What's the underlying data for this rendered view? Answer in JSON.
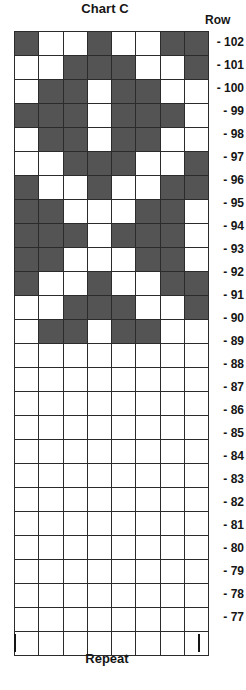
{
  "title": "Chart C",
  "row_header": "Row",
  "repeat_label": "Repeat",
  "colors": {
    "filled": "#545454",
    "empty": "#ffffff",
    "grid_line": "#2b2b2b",
    "text": "#151515"
  },
  "chart_data": {
    "type": "heatmap",
    "title": "Chart C",
    "xlabel": "Repeat",
    "ylabel": "Row",
    "columns": 8,
    "rows": 26,
    "legend": [
      {
        "symbol": "filled",
        "color": "#545454"
      },
      {
        "symbol": "empty",
        "color": "#ffffff"
      }
    ],
    "row_labels": [
      "- 102",
      "- 101",
      "- 100",
      "- 99",
      "- 98",
      "- 97",
      "- 96",
      "- 95",
      "- 94",
      "- 93",
      "- 92",
      "- 91",
      "- 90",
      "- 89",
      "- 88",
      "- 87",
      "- 86",
      "- 85",
      "- 84",
      "- 83",
      "- 82",
      "- 81",
      "- 80",
      "- 79",
      "- 78",
      "- 77"
    ],
    "row_numbers": [
      102,
      101,
      100,
      99,
      98,
      97,
      96,
      95,
      94,
      93,
      92,
      91,
      90,
      89,
      88,
      87,
      86,
      85,
      84,
      83,
      82,
      81,
      80,
      79,
      78,
      77
    ],
    "cells": [
      [
        1,
        0,
        0,
        1,
        0,
        0,
        1,
        1
      ],
      [
        0,
        0,
        1,
        1,
        1,
        0,
        0,
        1
      ],
      [
        0,
        1,
        1,
        0,
        1,
        1,
        0,
        0
      ],
      [
        1,
        1,
        1,
        0,
        1,
        1,
        1,
        0
      ],
      [
        0,
        1,
        1,
        0,
        1,
        1,
        0,
        0
      ],
      [
        0,
        0,
        1,
        1,
        1,
        0,
        0,
        1
      ],
      [
        1,
        0,
        0,
        1,
        0,
        0,
        1,
        1
      ],
      [
        1,
        1,
        0,
        0,
        0,
        1,
        1,
        0
      ],
      [
        1,
        1,
        1,
        0,
        1,
        1,
        1,
        0
      ],
      [
        1,
        1,
        0,
        0,
        0,
        1,
        1,
        0
      ],
      [
        1,
        0,
        0,
        1,
        0,
        0,
        1,
        1
      ],
      [
        0,
        0,
        1,
        1,
        1,
        0,
        0,
        1
      ],
      [
        0,
        1,
        1,
        0,
        1,
        1,
        0,
        0
      ],
      [
        0,
        0,
        0,
        0,
        0,
        0,
        0,
        0
      ],
      [
        0,
        0,
        0,
        0,
        0,
        0,
        0,
        0
      ],
      [
        0,
        0,
        0,
        0,
        0,
        0,
        0,
        0
      ],
      [
        0,
        0,
        0,
        0,
        0,
        0,
        0,
        0
      ],
      [
        0,
        0,
        0,
        0,
        0,
        0,
        0,
        0
      ],
      [
        0,
        0,
        0,
        0,
        0,
        0,
        0,
        0
      ],
      [
        0,
        0,
        0,
        0,
        0,
        0,
        0,
        0
      ],
      [
        0,
        0,
        0,
        0,
        0,
        0,
        0,
        0
      ],
      [
        0,
        0,
        0,
        0,
        0,
        0,
        0,
        0
      ],
      [
        0,
        0,
        0,
        0,
        0,
        0,
        0,
        0
      ],
      [
        0,
        0,
        0,
        0,
        0,
        0,
        0,
        0
      ],
      [
        0,
        0,
        0,
        0,
        0,
        0,
        0,
        0
      ],
      [
        0,
        0,
        0,
        0,
        0,
        0,
        0,
        0
      ]
    ]
  }
}
